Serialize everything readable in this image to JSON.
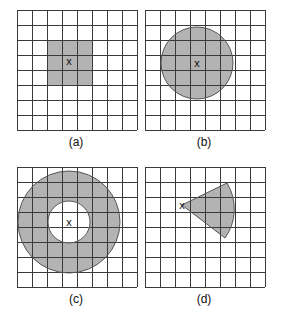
{
  "diagram": {
    "colors": {
      "background": "#ffffff",
      "grid": "#3a3a3a",
      "shade": "#b3b3b3",
      "outline": "#555555"
    },
    "grid": {
      "rows": 8,
      "cols": 8,
      "cell_px": 15
    },
    "center_marker": "x",
    "panels": [
      {
        "id": "a",
        "label": "(a)",
        "shape": "square",
        "origin": [
          17,
          10
        ],
        "marker": "x",
        "square": {
          "x": 47,
          "y": 40,
          "w": 45,
          "h": 45
        },
        "marker_pos": [
          69,
          65
        ],
        "label_pos": [
          76,
          146
        ]
      },
      {
        "id": "b",
        "label": "(b)",
        "shape": "circle",
        "origin": [
          145,
          10
        ],
        "marker": "x",
        "circle": {
          "cx": 197,
          "cy": 63,
          "r": 36
        },
        "marker_pos": [
          197,
          67
        ],
        "label_pos": [
          204,
          146
        ]
      },
      {
        "id": "c",
        "label": "(c)",
        "shape": "annulus",
        "origin": [
          17,
          167
        ],
        "marker": "x",
        "annulus": {
          "cx": 69,
          "cy": 222,
          "r_outer": 51,
          "r_inner": 21
        },
        "marker_pos": [
          69,
          226
        ],
        "label_pos": [
          76,
          303
        ]
      },
      {
        "id": "d",
        "label": "(d)",
        "shape": "sector",
        "origin": [
          145,
          167
        ],
        "marker": "x",
        "sector": {
          "apex": [
            182,
            205
          ],
          "start": [
            227,
            183
          ],
          "end": [
            225,
            238
          ],
          "r": 50
        },
        "marker_pos": [
          182,
          209
        ],
        "label_pos": [
          204,
          303
        ]
      }
    ]
  }
}
